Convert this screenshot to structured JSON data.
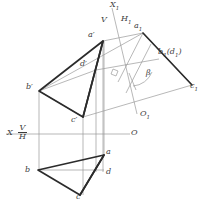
{
  "figure": {
    "type": "descriptive-geometry-projection",
    "background": "#ffffff",
    "ink_dark": "#2b2b2b",
    "ink_light": "#9a9a9a",
    "label_color": "#3c3c3c"
  },
  "labels": {
    "x1_axis": "X",
    "x1_axis_sub": "1",
    "v_upper": "V",
    "h1": "H",
    "h1_sub": "1",
    "a_front": "a′",
    "b_front": "b′",
    "c_front": "c′",
    "d_front": "d′",
    "a_aux": "a",
    "a_aux_sub": "1",
    "bd_aux": "b",
    "bd_aux_sub": "1",
    "bd_aux_paren": "(d",
    "bd_aux_paren_sub": "1",
    "bd_aux_paren_close": ")",
    "c_aux": "c",
    "c_aux_sub": "1",
    "o_aux": "O",
    "o_aux_sub": "1",
    "beta": "β",
    "x_axis": "X",
    "v_lower": "V",
    "h_lower": "H",
    "o_axis": "O",
    "a_top": "a",
    "b_top": "b",
    "c_top": "c",
    "d_top": "d"
  },
  "geometry": {
    "front_view": {
      "a_prime": [
        103,
        41
      ],
      "b_prime": [
        39,
        91
      ],
      "c_prime": [
        83,
        117
      ],
      "d_prime": [
        96,
        70
      ]
    },
    "top_view": {
      "a": [
        104,
        155
      ],
      "b": [
        38,
        170
      ],
      "c": [
        80,
        195
      ],
      "d": [
        103,
        172
      ]
    },
    "aux_view": {
      "a1": [
        143,
        33
      ],
      "b1d1": [
        159,
        59
      ],
      "c1": [
        192,
        85
      ]
    },
    "ground_line": {
      "y": 134,
      "x_start": 6,
      "x_end": 130
    },
    "x1_axis": {
      "top": [
        112,
        8
      ],
      "bottom": [
        137,
        114
      ]
    },
    "angle_beta_deg": 22
  }
}
